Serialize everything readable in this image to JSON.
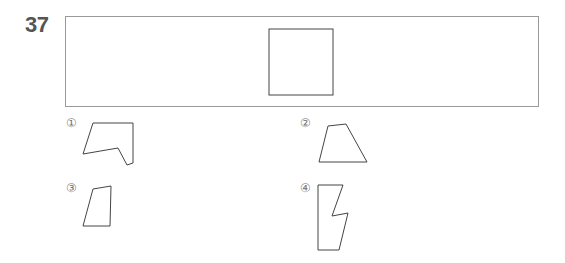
{
  "question": {
    "number": "37"
  },
  "stimulus": {
    "shape": "square"
  },
  "options": [
    {
      "label": "①",
      "shape": "irregular-hexagon"
    },
    {
      "label": "②",
      "shape": "trapezoid"
    },
    {
      "label": "③",
      "shape": "quadrilateral"
    },
    {
      "label": "④",
      "shape": "zigzag-hexagon"
    }
  ],
  "colors": {
    "stroke": "#444444",
    "frame": "#9a9a9a",
    "number": "#555555"
  }
}
